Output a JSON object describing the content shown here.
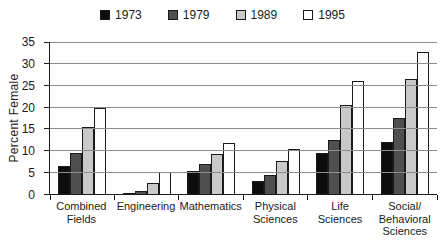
{
  "chart_data": {
    "type": "bar",
    "title": "",
    "xlabel": "",
    "ylabel": "Percent Female",
    "ylim": [
      0,
      35
    ],
    "ytick_step": 5,
    "grid": "horizontal",
    "legend_position": "top-center",
    "categories": [
      "Combined Fields",
      "Engineering",
      "Mathematics",
      "Physical Sciences",
      "Life Sciences",
      "Social/Behavioral Sciences"
    ],
    "category_label_lines": [
      [
        "Combined",
        "Fields"
      ],
      [
        "Engineering"
      ],
      [
        "Mathematics"
      ],
      [
        "Physical",
        "Sciences"
      ],
      [
        "Life Sciences"
      ],
      [
        "Social/",
        "Behavioral",
        "Sciences"
      ]
    ],
    "series": [
      {
        "name": "1973",
        "color": "#0d0d0d",
        "values": [
          6.5,
          0.2,
          5.4,
          3.0,
          9.4,
          12.0
        ]
      },
      {
        "name": "1979",
        "color": "#4f4f4f",
        "values": [
          9.4,
          0.8,
          7.0,
          4.4,
          12.5,
          17.6
        ]
      },
      {
        "name": "1989",
        "color": "#c9c9c9",
        "values": [
          15.5,
          2.6,
          9.2,
          7.7,
          20.6,
          26.4
        ]
      },
      {
        "name": "1995",
        "color": "#ffffff",
        "values": [
          19.8,
          5.0,
          11.7,
          10.4,
          26.0,
          32.7
        ]
      }
    ],
    "colors": {
      "background": "#ffffff",
      "axis": "#1a1a1a",
      "gridline": "#8c8c8c",
      "bar_border": "#1a1a1a",
      "text": "#1a1a1a"
    }
  }
}
